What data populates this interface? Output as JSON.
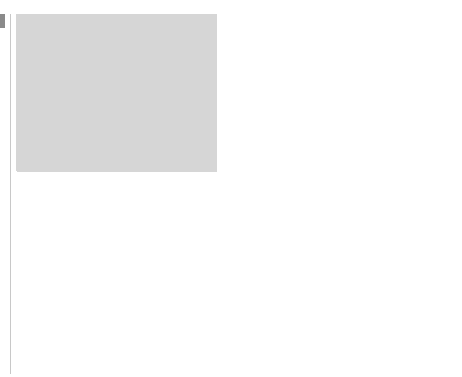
{
  "map": {
    "title": "Black Panther branches in the United States",
    "colors": {
      "ocean": "#d6d6d6",
      "land": "#b4b4b4",
      "branch_state": "#9a9a9a",
      "border": "#555555",
      "frame": "#777777"
    },
    "region_labels": {
      "british": "BRITISH",
      "canada": "CANADA",
      "mexico": "MEXICO",
      "pacific_1": "Pacific",
      "pacific_2": "Ocean",
      "atlantic_1": "Atlantic",
      "atlantic_2": "Ocean",
      "gulf": "Gulf of Mexico"
    },
    "annotation": {
      "line1": "Black Panthers",
      "line2": "founded in 1966,",
      "line3": "Oakland"
    },
    "cities": [
      {
        "name": "San Fransisco",
        "x": 41,
        "y": 157
      },
      {
        "name": "Oakland",
        "x": 45,
        "y": 154
      },
      {
        "name": "Los Angeles",
        "x": 60,
        "y": 197
      },
      {
        "name": "Chicago",
        "x": 291,
        "y": 137
      },
      {
        "name": "Indianapolis",
        "x": 303,
        "y": 154
      },
      {
        "name": "Detroit",
        "x": 328,
        "y": 131
      },
      {
        "name": "Pittsburgh",
        "x": 354,
        "y": 148
      },
      {
        "name": "Philadelphia",
        "x": 384,
        "y": 148
      },
      {
        "name": "Baltimore",
        "x": 377,
        "y": 155
      },
      {
        "name": "Newark",
        "x": 392,
        "y": 145
      },
      {
        "name": "New York City",
        "x": 392,
        "y": 135
      },
      {
        "name": "New Haven",
        "x": 396,
        "y": 128
      },
      {
        "name": "Hartford",
        "x": 402,
        "y": 126
      },
      {
        "name": "Boston",
        "x": 405,
        "y": 124
      }
    ],
    "branch_states": [
      "California",
      "Illinois",
      "Indiana",
      "Michigan",
      "Ohio",
      "Pennsylvania",
      "New York",
      "New Jersey",
      "Connecticut",
      "Massachusetts",
      "Maryland",
      "Delaware"
    ]
  },
  "legend": {
    "cities_label_1": "Cities with Black",
    "cities_label_2": "Panther branches",
    "states_label": "States with branches",
    "scale": {
      "ticks": [
        "0",
        "200",
        "400"
      ],
      "unit": "Miles"
    }
  }
}
